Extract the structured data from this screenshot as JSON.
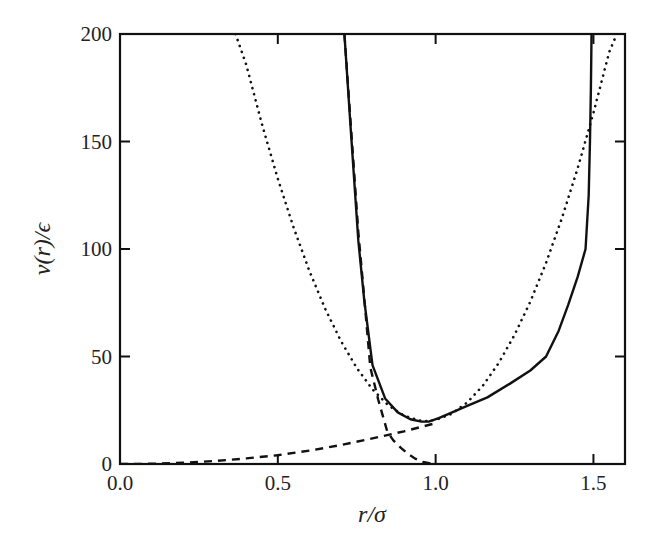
{
  "chart_data": {
    "type": "line",
    "title": "",
    "xlabel": "r/σ",
    "ylabel": "v(r)/ϵ",
    "xlim": [
      0.0,
      1.6
    ],
    "ylim": [
      0,
      200
    ],
    "grid": false,
    "legend": null,
    "x_ticks": [
      {
        "value": 0.0,
        "label": "0.0"
      },
      {
        "value": 0.5,
        "label": "0.5"
      },
      {
        "value": 1.0,
        "label": "1.0"
      },
      {
        "value": 1.5,
        "label": "1.5"
      }
    ],
    "y_ticks": [
      {
        "value": 0,
        "label": "0"
      },
      {
        "value": 50,
        "label": "50"
      },
      {
        "value": 100,
        "label": "100"
      },
      {
        "value": 150,
        "label": "150"
      },
      {
        "value": 200,
        "label": "200"
      }
    ],
    "series": [
      {
        "name": "total potential",
        "style": "solid",
        "color": "#111111",
        "x": [
          0.711,
          0.73,
          0.755,
          0.774,
          0.8,
          0.84,
          0.88,
          0.92,
          0.955,
          0.98,
          1.01,
          1.047,
          1.1,
          1.164,
          1.237,
          1.3,
          1.35,
          1.39,
          1.42,
          1.45,
          1.475,
          1.485,
          1.489,
          1.492,
          1.494
        ],
        "y": [
          200,
          158,
          104,
          76,
          46,
          30.5,
          24,
          20.8,
          19.7,
          19.8,
          21.3,
          23.7,
          27,
          31,
          37.5,
          43.5,
          50,
          62,
          74,
          87,
          100,
          125,
          150,
          175,
          200
        ]
      },
      {
        "name": "repulsive part",
        "style": "dashed",
        "color": "#111111",
        "x": [
          0.711,
          0.735,
          0.755,
          0.774,
          0.793,
          0.818,
          0.847,
          0.866,
          0.89,
          0.91,
          0.935,
          0.96,
          0.99
        ],
        "y": [
          200,
          150,
          108,
          77,
          45,
          30,
          15,
          11,
          7.5,
          5,
          2.5,
          1,
          0
        ]
      },
      {
        "name": "attractive part",
        "style": "dashed",
        "color": "#111111",
        "x": [
          0.0,
          0.1,
          0.2,
          0.3,
          0.4,
          0.5,
          0.6,
          0.7,
          0.8,
          0.9,
          0.95,
          1.0
        ],
        "y": [
          0,
          0.1,
          0.6,
          1.4,
          2.6,
          4.1,
          6.2,
          8.8,
          11.9,
          15.2,
          17.1,
          19
        ]
      },
      {
        "name": "harmonic approximation",
        "style": "dotted",
        "color": "#111111",
        "x": [
          0.366,
          0.4,
          0.45,
          0.5,
          0.55,
          0.6,
          0.65,
          0.7,
          0.75,
          0.8,
          0.85,
          0.9,
          0.95,
          0.97,
          1.0,
          1.05,
          1.1,
          1.15,
          1.2,
          1.25,
          1.3,
          1.35,
          1.4,
          1.45,
          1.5,
          1.55,
          1.574
        ],
        "y": [
          200,
          185.7,
          157.9,
          132.7,
          110,
          89.8,
          72.2,
          57.2,
          44.7,
          34.7,
          27.3,
          22.5,
          20.2,
          20,
          20.5,
          23.3,
          28.6,
          36.5,
          47,
          60,
          75.5,
          93.6,
          114.3,
          137.5,
          163.3,
          191.6,
          200
        ]
      }
    ]
  }
}
